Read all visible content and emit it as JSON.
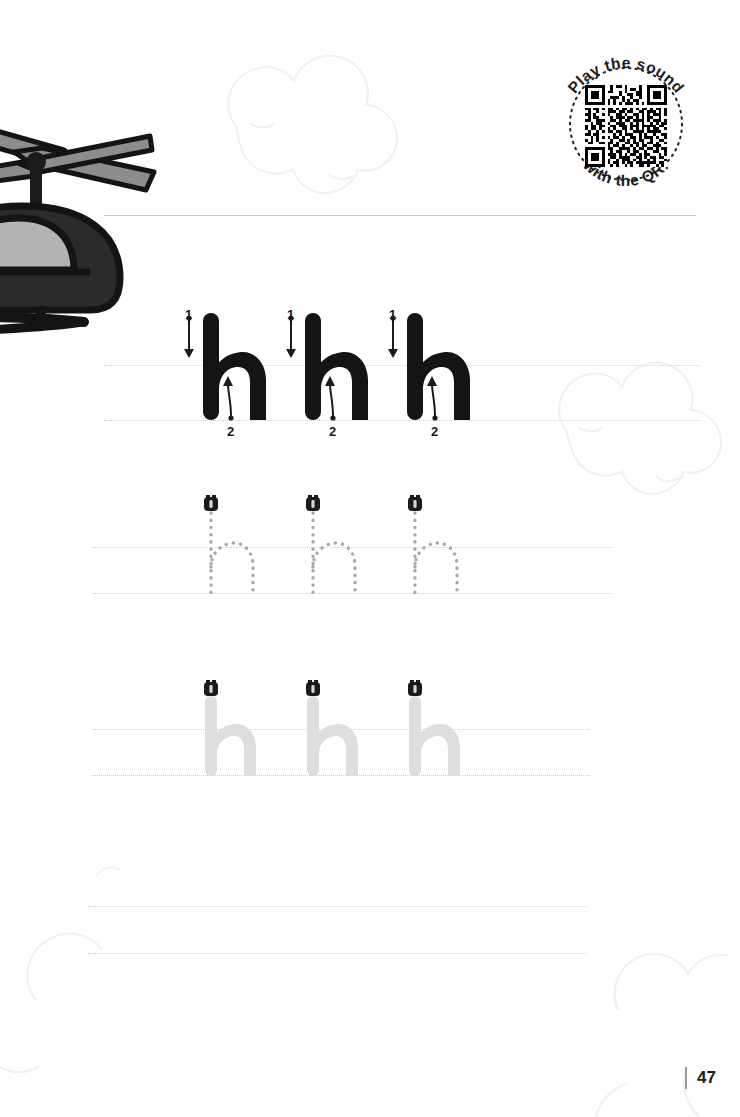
{
  "worksheet": {
    "letter": "h",
    "letter_case": "lowercase",
    "theme_word": "helicopter",
    "page_number": "47"
  },
  "qr_badge": {
    "text_top": "Play the sound",
    "text_bottom": "with the QR!",
    "icon": "qr-code-icon"
  },
  "illustration": {
    "name": "helicopter-illustration",
    "colors": {
      "body": "#2b2b2b",
      "window": "#b3b3b3",
      "rotor": "#8c8c8c",
      "outline": "#1b1b1b"
    }
  },
  "rows": [
    {
      "id": "row-solid",
      "style": "solid-black",
      "letter": "h",
      "count": 3,
      "color": "#141414",
      "show_stroke_numbers": true,
      "show_start_marker": false,
      "stroke_labels": [
        "1",
        "2"
      ],
      "stroke_hint_1": "down-arrow",
      "stroke_hint_2": "curve-up-arrow"
    },
    {
      "id": "row-dotted",
      "style": "dotted-outline",
      "letter": "h",
      "count": 3,
      "color": "#9d9d9d",
      "show_stroke_numbers": false,
      "show_start_marker": true,
      "marker_icon": "pencil-start-icon"
    },
    {
      "id": "row-ghost",
      "style": "light-gray-solid",
      "letter": "h",
      "count": 3,
      "color": "#dcdcdc",
      "show_stroke_numbers": false,
      "show_start_marker": true,
      "marker_icon": "pencil-start-icon"
    },
    {
      "id": "row-blank-1",
      "style": "blank",
      "letter": "",
      "count": 0,
      "show_stroke_numbers": false,
      "show_start_marker": false
    },
    {
      "id": "row-blank-2",
      "style": "blank",
      "letter": "",
      "count": 0,
      "show_stroke_numbers": false,
      "show_start_marker": false
    }
  ],
  "colors": {
    "guide_line": "#cfcfcf",
    "header_rule": "#c9c9c9",
    "cloud_outline": "#f2f2f2",
    "ink_black": "#141414",
    "ghost_gray": "#dcdcdc"
  }
}
